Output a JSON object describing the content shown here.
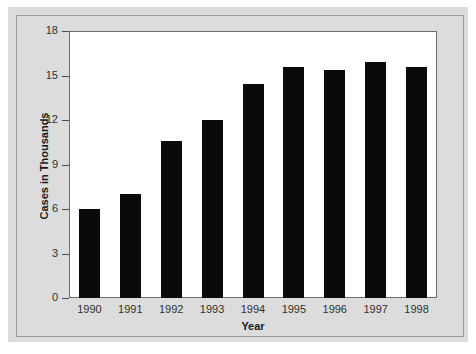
{
  "chart_data": {
    "type": "bar",
    "title": "",
    "subtitle": "",
    "xlabel": "Year",
    "ylabel": "Cases in Thousands",
    "categories": [
      "1990",
      "1991",
      "1992",
      "1993",
      "1994",
      "1995",
      "1996",
      "1997",
      "1998"
    ],
    "values": [
      6.0,
      7.0,
      10.6,
      12.0,
      14.4,
      15.6,
      15.4,
      15.9,
      15.6
    ],
    "ylim": [
      0,
      18
    ],
    "yticks": [
      0,
      3,
      6,
      9,
      12,
      15,
      18
    ],
    "ytick_labels": [
      "0",
      "3",
      "6",
      "9",
      "12",
      "15",
      "18"
    ],
    "grid": false,
    "legend": null,
    "bar_color": "#0a0a0a",
    "plot_background": "#ffffff",
    "figure_background": "#dcdcdc",
    "series": [
      {
        "name": "Cases",
        "values": [
          6.0,
          7.0,
          10.6,
          12.0,
          14.4,
          15.6,
          15.4,
          15.9,
          15.6
        ]
      }
    ],
    "annotations": []
  }
}
